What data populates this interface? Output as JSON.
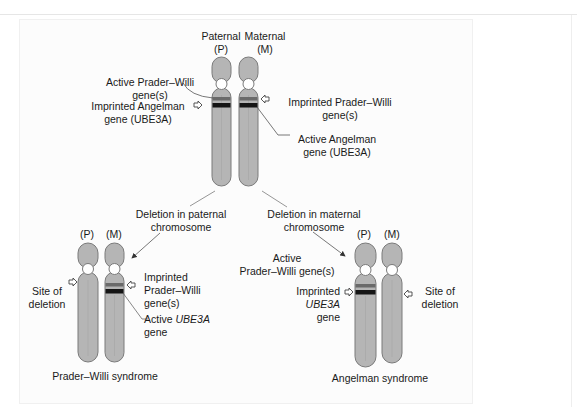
{
  "diagram": {
    "type": "chromosome imprinting diagram",
    "colors": {
      "chromosome_fill": "#b5b5b5",
      "chromosome_stroke": "#7a7a7a",
      "centromere_fill": "#ffffff",
      "imprinted_band": "#6a6a6a",
      "active_band": "#151515",
      "line": "#8a8a8a"
    },
    "top": {
      "paternal_label_1": "Paternal",
      "paternal_label_2": "(P)",
      "maternal_label_1": "Maternal",
      "maternal_label_2": "(M)",
      "active_pw_1": "Active Prader–Willi",
      "active_pw_2": "gene(s)",
      "imprinted_angelman_1": "Imprinted Angelman",
      "imprinted_angelman_2": "gene (UBE3A)",
      "imprinted_pw_1": "Imprinted Prader–Willi",
      "imprinted_pw_2": "gene(s)",
      "active_angelman_1": "Active Angelman",
      "active_angelman_2": "gene (UBE3A)"
    },
    "branch_left": {
      "label_1": "Deletion in paternal",
      "label_2": "chromosome"
    },
    "branch_right": {
      "label_1": "Deletion in maternal",
      "label_2": "chromosome"
    },
    "bottom_left": {
      "p_label": "(P)",
      "m_label": "(M)",
      "site_1": "Site of",
      "site_2": "deletion",
      "imprinted_pw_1": "Imprinted",
      "imprinted_pw_2": "Prader–Willi",
      "imprinted_pw_3": "gene(s)",
      "active_ube3a_prefix": "Active ",
      "active_ube3a_gene": "UBE3A",
      "active_ube3a_2": "gene",
      "title": "Prader–Willi syndrome"
    },
    "bottom_right": {
      "p_label": "(P)",
      "m_label": "(M)",
      "active_pw_1": "Active",
      "active_pw_2": "Prader–Willi gene(s)",
      "imprinted_1": "Imprinted",
      "imprinted_2": "UBE3A",
      "imprinted_3": "gene",
      "site_1": "Site of",
      "site_2": "deletion",
      "title": "Angelman syndrome"
    }
  }
}
